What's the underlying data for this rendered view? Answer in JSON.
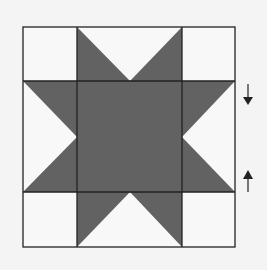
{
  "diagram": {
    "type": "quilt-block",
    "pattern": "sawtooth-star",
    "grid": "3x3",
    "colors": {
      "background": "#f4f4f4",
      "light_fabric": "#f8f8f8",
      "dark_fabric": "#626262",
      "outline": "#222222"
    },
    "block": {
      "x0": 23,
      "y0": 27,
      "x1": 235,
      "y1": 247
    },
    "annotations": [
      {
        "type": "arrow",
        "direction": "down",
        "x": 248,
        "y_from": 84,
        "y_to": 104
      },
      {
        "type": "arrow",
        "direction": "up",
        "x": 248,
        "y_from": 192,
        "y_to": 170
      }
    ]
  }
}
